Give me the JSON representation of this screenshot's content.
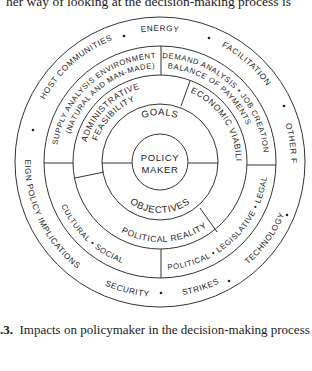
{
  "page": {
    "top_text": "her way of looking at the decision-making process is",
    "caption_label": ".3.",
    "caption_text": "Impacts on policymaker in the decision-making process."
  },
  "diagram": {
    "center": "POLICY MAKER",
    "center_lines": [
      "POLICY",
      "MAKER"
    ],
    "inner_ring": {
      "top": "GOALS",
      "bottom": "OBJECTIVES"
    },
    "third_ring": {
      "upper_left": [
        "ADMINISTRATIVE",
        "FEASIBILITY"
      ],
      "right": "ECONOMIC VIABILITY",
      "bottom": "POLITICAL REALITY"
    },
    "fourth_ring": {
      "upper_left": [
        "SUPPLY ANALYSIS ENVIRONMENT",
        "(NATURAL AND MAN-MADE)"
      ],
      "upper_right": [
        "DEMAND ANALYSIS • JOB CREATION",
        "BALANCE OF PAYMENTS"
      ],
      "lower_left": "CULTURAL  •  SOCIAL",
      "lower_right": "POLITICAL • LEGISLATIVE • LEGAL"
    },
    "outer_ring": {
      "items": [
        "ENERGY",
        "FACILITATION",
        "OTHER FACTORS",
        "TECHNOLOGY",
        "STRIKES",
        "SECURITY",
        "FOREIGN POLICY IMPLICATIONS",
        "HOST COMMUNITIES"
      ],
      "top": "ENERGY",
      "upper_right": "FACILITATION",
      "right": "OTHER FACTORS",
      "lower_right": "TECHNOLOGY",
      "bottom_right": "STRIKES",
      "bottom_left": "SECURITY",
      "left": "FOREIGN POLICY IMPLICATIONS",
      "upper_left": "HOST COMMUNITIES"
    }
  }
}
